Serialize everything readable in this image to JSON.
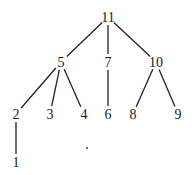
{
  "tree": {
    "root": "11",
    "nodes": [
      {
        "id": "11",
        "label": "11"
      },
      {
        "id": "5",
        "label": "5"
      },
      {
        "id": "7",
        "label": "7"
      },
      {
        "id": "10",
        "label": "10"
      },
      {
        "id": "2",
        "label": "2"
      },
      {
        "id": "3",
        "label": "3"
      },
      {
        "id": "4",
        "label": "4"
      },
      {
        "id": "6",
        "label": "6"
      },
      {
        "id": "8",
        "label": "8"
      },
      {
        "id": "9",
        "label": "9"
      },
      {
        "id": "1",
        "label": "1"
      }
    ],
    "edges": [
      {
        "from": "11",
        "to": "5"
      },
      {
        "from": "11",
        "to": "7"
      },
      {
        "from": "11",
        "to": "10"
      },
      {
        "from": "5",
        "to": "2"
      },
      {
        "from": "5",
        "to": "3"
      },
      {
        "from": "5",
        "to": "4"
      },
      {
        "from": "7",
        "to": "6"
      },
      {
        "from": "10",
        "to": "8"
      },
      {
        "from": "10",
        "to": "9"
      },
      {
        "from": "2",
        "to": "1"
      }
    ]
  }
}
